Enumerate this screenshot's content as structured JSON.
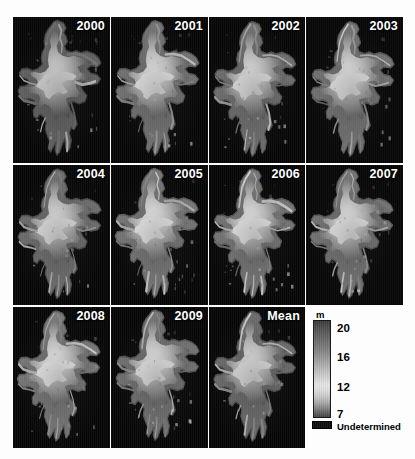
{
  "figure": {
    "type": "map-grid",
    "background_color": "#fdfdfd",
    "panel_background_color": "#070707"
  },
  "panels": [
    {
      "label": "2000",
      "row": 1,
      "col": 1,
      "x": 13,
      "y": 17,
      "w": 97,
      "h": 146
    },
    {
      "label": "2001",
      "row": 1,
      "col": 2,
      "x": 111,
      "y": 17,
      "w": 97,
      "h": 146
    },
    {
      "label": "2002",
      "row": 1,
      "col": 3,
      "x": 209,
      "y": 17,
      "w": 96,
      "h": 146
    },
    {
      "label": "2003",
      "row": 1,
      "col": 4,
      "x": 306,
      "y": 17,
      "w": 97,
      "h": 146
    },
    {
      "label": "2004",
      "row": 2,
      "col": 1,
      "x": 13,
      "y": 165,
      "w": 97,
      "h": 140
    },
    {
      "label": "2005",
      "row": 2,
      "col": 2,
      "x": 111,
      "y": 165,
      "w": 97,
      "h": 140
    },
    {
      "label": "2006",
      "row": 2,
      "col": 3,
      "x": 209,
      "y": 165,
      "w": 96,
      "h": 140
    },
    {
      "label": "2007",
      "row": 2,
      "col": 4,
      "x": 306,
      "y": 165,
      "w": 97,
      "h": 140
    },
    {
      "label": "2008",
      "row": 3,
      "col": 1,
      "x": 13,
      "y": 307,
      "w": 97,
      "h": 141
    },
    {
      "label": "2009",
      "row": 3,
      "col": 2,
      "x": 111,
      "y": 307,
      "w": 97,
      "h": 141
    },
    {
      "label": "Mean",
      "row": 3,
      "col": 3,
      "x": 209,
      "y": 307,
      "w": 96,
      "h": 141
    }
  ],
  "legend": {
    "unit_label": "m",
    "colorbar": {
      "x": 313,
      "y": 320,
      "w": 18,
      "h": 98
    },
    "ticks": [
      {
        "value": "20",
        "y": 323
      },
      {
        "value": "16",
        "y": 352
      },
      {
        "value": "12",
        "y": 382
      },
      {
        "value": "7",
        "y": 409
      }
    ],
    "undetermined_label": "Undetermined",
    "undetermined_swatch_color": "#0b0b0b",
    "scale_min": 7,
    "scale_max": 20
  },
  "chart_data": {
    "type": "heatmap",
    "title": "",
    "xlabel": "",
    "ylabel": "",
    "colorbar_label": "m",
    "colorbar_ticks": [
      20,
      16,
      12,
      7
    ],
    "colorbar_range": [
      7,
      20
    ],
    "extra_category": "Undetermined",
    "panels": [
      "2000",
      "2001",
      "2002",
      "2003",
      "2004",
      "2005",
      "2006",
      "2007",
      "2008",
      "2009",
      "Mean"
    ],
    "grid": false,
    "legend_position": "right"
  }
}
